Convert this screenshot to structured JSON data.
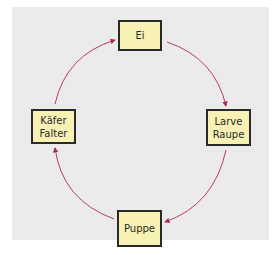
{
  "diagram": {
    "title": "",
    "colors": {
      "arrow": "#b0284e",
      "box_fill": "#f7f2b4",
      "box_border": "#2a2a2a",
      "background": "#ebebeb"
    },
    "nodes": [
      {
        "id": "ei",
        "lines": [
          "Ei"
        ]
      },
      {
        "id": "larve",
        "lines": [
          "Larve",
          "Raupe"
        ]
      },
      {
        "id": "puppe",
        "lines": [
          "Puppe"
        ]
      },
      {
        "id": "kaefer",
        "lines": [
          "Käfer",
          "Falter"
        ]
      }
    ],
    "edges": [
      {
        "from": "ei",
        "to": "larve"
      },
      {
        "from": "larve",
        "to": "puppe"
      },
      {
        "from": "puppe",
        "to": "kaefer"
      },
      {
        "from": "kaefer",
        "to": "ei"
      }
    ]
  }
}
